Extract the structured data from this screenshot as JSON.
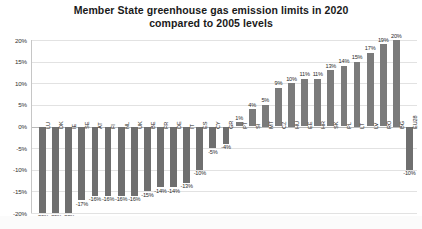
{
  "chart": {
    "title_line1": "Member State greenhouse gas emission limits in 2020",
    "title_line2": "compared to 2005 levels",
    "y_ticks": [
      "20%",
      "15%",
      "10%",
      "5%",
      "0%",
      "-5%",
      "-10%",
      "-15%",
      "-20%"
    ],
    "bar_color": "#7b7b7b",
    "grid_color": "#e2e2e2"
  },
  "chart_data": {
    "type": "bar",
    "title": "Member State greenhouse gas emission limits in 2020 compared to 2005 levels",
    "xlabel": "",
    "ylabel": "",
    "ylim": [
      -20,
      20
    ],
    "grid": true,
    "legend": "none",
    "categories": [
      "LU",
      "DK",
      "IE",
      "SE",
      "AT",
      "FI",
      "NL",
      "UK",
      "BE",
      "FR",
      "DE",
      "IT",
      "ES",
      "CY",
      "GR",
      "PT",
      "SI",
      "MT",
      "CZ",
      "HU",
      "EE",
      "HR",
      "SK",
      "PL",
      "LT",
      "LV",
      "RO",
      "BG",
      "EU28"
    ],
    "values": [
      -20,
      -20,
      -20,
      -17,
      -16,
      -16,
      -16,
      -16,
      -15,
      -14,
      -14,
      -13,
      -10,
      -5,
      -4,
      1,
      4,
      5,
      9,
      10,
      11,
      11,
      13,
      14,
      15,
      17,
      19,
      20,
      -10
    ],
    "value_labels": [
      "-20%",
      "-20%",
      "-20%",
      "-17%",
      "-16%",
      "-16%",
      "-16%",
      "-16%",
      "-15%",
      "-14%",
      "-14%",
      "-13%",
      "-10%",
      "-5%",
      "-4%",
      "1%",
      "4%",
      "5%",
      "9%",
      "10%",
      "11%",
      "11%",
      "13%",
      "14%",
      "15%",
      "17%",
      "19%",
      "20%",
      "-10%"
    ],
    "y_tick_values": [
      20,
      15,
      10,
      5,
      0,
      -5,
      -10,
      -15,
      -20
    ]
  }
}
